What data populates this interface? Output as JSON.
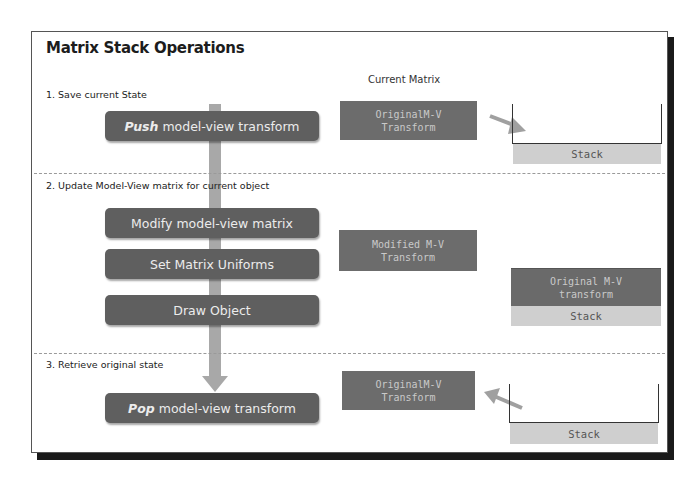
{
  "title": "Matrix Stack Operations",
  "column_header": "Current Matrix",
  "sections": [
    {
      "label": "1. Save current State",
      "steps": [
        {
          "emphasis": "Push",
          "text": "model-view transform"
        }
      ],
      "current_matrix": [
        "OriginalM-V",
        "Transform"
      ],
      "stack": {
        "label": "Stack",
        "contents": []
      },
      "arrow": "matrix-to-stack"
    },
    {
      "label": "2. Update Model-View matrix for current object",
      "steps": [
        {
          "emphasis": "",
          "text": "Modify model-view matrix"
        },
        {
          "emphasis": "",
          "text": "Set Matrix Uniforms"
        },
        {
          "emphasis": "",
          "text": "Draw Object"
        }
      ],
      "current_matrix": [
        "Modified M-V",
        "Transform"
      ],
      "stack": {
        "label": "Stack",
        "contents": [
          [
            "Original M-V",
            "transform"
          ]
        ]
      }
    },
    {
      "label": "3. Retrieve original state",
      "steps": [
        {
          "emphasis": "Pop",
          "text": "model-view transform"
        }
      ],
      "current_matrix": [
        "OriginalM-V",
        "Transform"
      ],
      "stack": {
        "label": "Stack",
        "contents": []
      },
      "arrow": "stack-to-matrix"
    }
  ],
  "colors": {
    "step_box": "#5f5f5f",
    "matrix_box": "#6c6c6c",
    "stack_label": "#cfcfcf",
    "flow_arrow": "#a8a8a8",
    "frame_shadow": "#1a1a1a"
  }
}
